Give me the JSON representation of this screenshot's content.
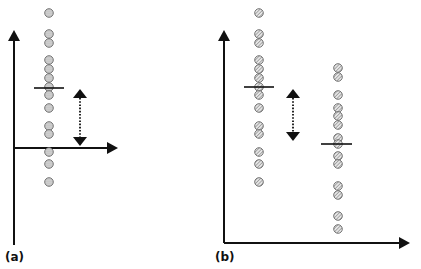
{
  "panels": [
    {
      "id": "a",
      "label": "(a)",
      "label_pos": [
        5,
        250
      ],
      "axes": {
        "origin_x": 14,
        "y_top": 30,
        "y_bottom": 245,
        "x_axis_y": 148,
        "x_right": 118
      },
      "groups": [
        {
          "x": 49,
          "points_y": [
            13,
            34,
            43,
            60,
            69,
            78,
            87,
            95,
            108,
            126,
            134,
            152,
            164,
            182
          ],
          "mean_y": 88,
          "mean_x1": 34,
          "mean_x2": 64,
          "fill": "dotted"
        }
      ],
      "double_arrow": {
        "x": 80,
        "y1": 89,
        "y2": 146
      }
    },
    {
      "id": "b",
      "label": "(b)",
      "label_pos": [
        215,
        250
      ],
      "axes": {
        "origin_x": 224,
        "y_top": 30,
        "y_bottom": 243,
        "x_axis_y": 243,
        "x_right": 410
      },
      "groups": [
        {
          "x": 259,
          "points_y": [
            13,
            34,
            43,
            60,
            69,
            78,
            87,
            95,
            108,
            126,
            134,
            152,
            164,
            182
          ],
          "mean_y": 87,
          "mean_x1": 244,
          "mean_x2": 274,
          "fill": "hatched"
        },
        {
          "x": 338,
          "points_y": [
            68,
            77,
            95,
            108,
            116,
            125,
            138,
            144,
            156,
            164,
            186,
            195,
            216,
            229
          ],
          "mean_y": 144,
          "mean_x1": 321,
          "mean_x2": 352,
          "fill": "hatched"
        }
      ],
      "double_arrow": {
        "x": 293,
        "y1": 89,
        "y2": 141
      }
    }
  ],
  "colors": {
    "axis": "#111111",
    "circle_stroke": "#666666",
    "circle_fill": "#d4d4d4",
    "hatch": "#777777"
  }
}
